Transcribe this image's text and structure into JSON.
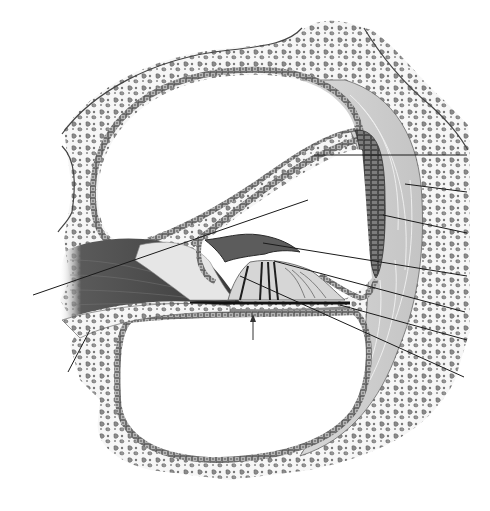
{
  "diagram": {
    "style": "grayscale anatomical illustration",
    "labels_visible": false,
    "colors": {
      "background": "#ffffff",
      "bone_fill": "#f4f4f4",
      "bone_granule": "#8a8a8a",
      "bone_outline": "#3a3a3a",
      "epithelium": "#6e6e6e",
      "ligament": "#cfcfcf",
      "stria": "#5a5a5a",
      "nerve_dark": "#3c3c3c",
      "tectorial": "#555555",
      "leader_line": "#1a1a1a"
    },
    "regions": [
      {
        "id": "scala-vestibuli",
        "name": "Scala vestibuli"
      },
      {
        "id": "scala-media",
        "name": "Scala media (cochlear duct)"
      },
      {
        "id": "scala-tympani",
        "name": "Scala tympani"
      },
      {
        "id": "vestibular-membrane",
        "name": "Vestibular membrane"
      },
      {
        "id": "stria-vascularis",
        "name": "Stria vascularis"
      },
      {
        "id": "spiral-ligament",
        "name": "Spiral ligament"
      },
      {
        "id": "tectorial-membrane",
        "name": "Tectorial membrane"
      },
      {
        "id": "organ-of-corti",
        "name": "Spiral organ (organ of Corti)"
      },
      {
        "id": "basilar-membrane",
        "name": "Basilar membrane"
      },
      {
        "id": "cochlear-nerve",
        "name": "Cochlear nerve fibers"
      },
      {
        "id": "osseous-spiral-lamina",
        "name": "Osseous spiral lamina"
      },
      {
        "id": "bony-wall",
        "name": "Bony cochlear wall"
      }
    ],
    "leader_lines": [
      {
        "side": "right",
        "label": ""
      },
      {
        "side": "right",
        "label": ""
      },
      {
        "side": "right",
        "label": ""
      },
      {
        "side": "right",
        "label": ""
      },
      {
        "side": "right",
        "label": ""
      },
      {
        "side": "right",
        "label": ""
      },
      {
        "side": "right",
        "label": ""
      },
      {
        "side": "left",
        "label": ""
      },
      {
        "side": "left",
        "label": ""
      }
    ]
  }
}
